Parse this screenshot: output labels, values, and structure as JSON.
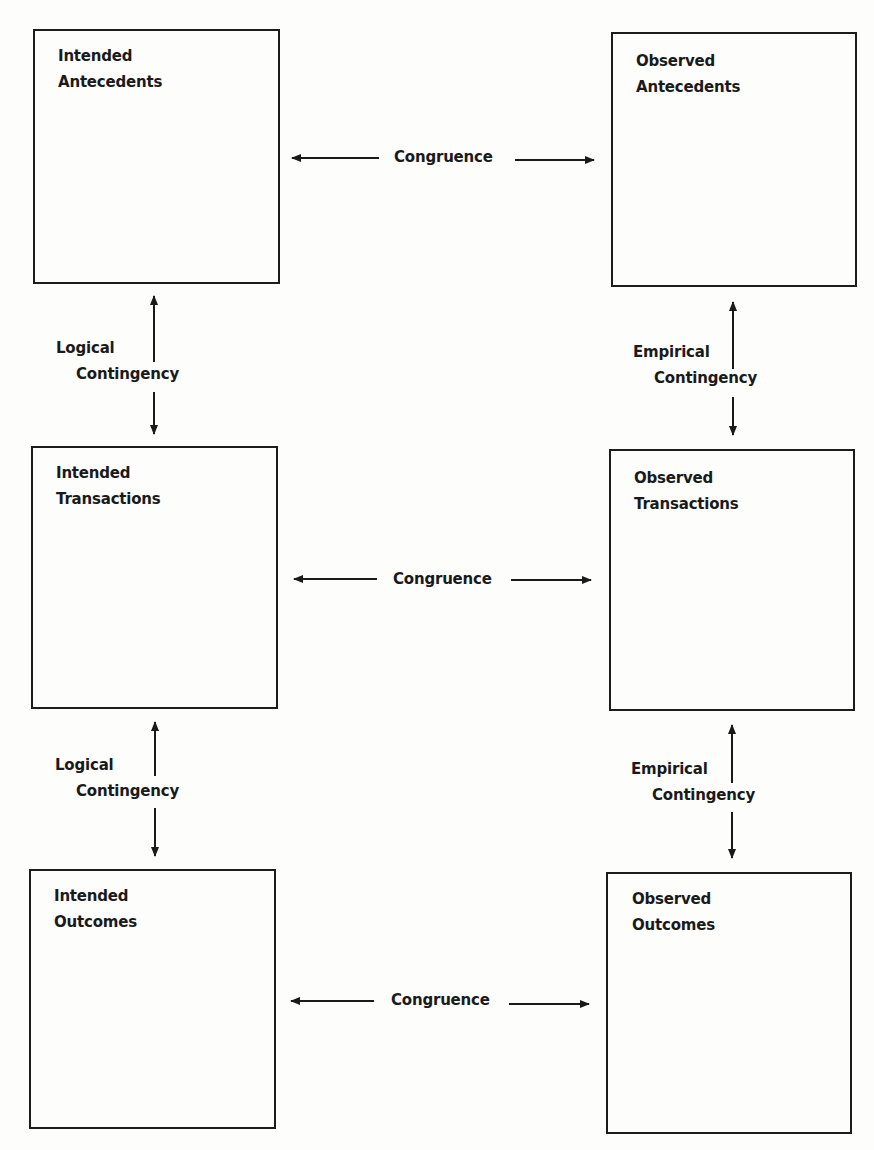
{
  "diagram": {
    "boxes": {
      "intended_antecedents": {
        "line1": "Intended",
        "line2": "Antecedents"
      },
      "observed_antecedents": {
        "line1": "Observed",
        "line2": "Antecedents"
      },
      "intended_transactions": {
        "line1": "Intended",
        "line2": "Transactions"
      },
      "observed_transactions": {
        "line1": "Observed",
        "line2": "Transactions"
      },
      "intended_outcomes": {
        "line1": "Intended",
        "line2": "Outcomes"
      },
      "observed_outcomes": {
        "line1": "Observed",
        "line2": "Outcomes"
      }
    },
    "congruence_labels": [
      "Congruence",
      "Congruence",
      "Congruence"
    ],
    "logical_contingency": [
      {
        "line1": "Logical",
        "line2": "Contingency"
      },
      {
        "line1": "Logical",
        "line2": "Contingency"
      }
    ],
    "empirical_contingency": [
      {
        "line1": "Empirical",
        "line2": "Contingency"
      },
      {
        "line1": "Empirical",
        "line2": "Contingency"
      }
    ]
  }
}
